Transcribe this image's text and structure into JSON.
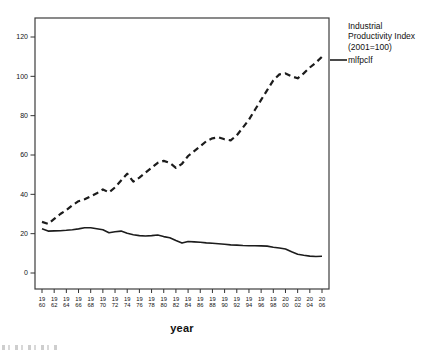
{
  "figure": {
    "background": "#ffffff",
    "line_color": "#1c1c1c",
    "border_color": "#3c3c3c",
    "tick_color": "#333333",
    "text_color": "#111111"
  },
  "legend": {
    "series1_lines": [
      "Industrial",
      "Productivity Index",
      "(2001=100)"
    ],
    "series2_label": "mlfpclf"
  },
  "chart_data": {
    "type": "line",
    "title": "",
    "xlabel": "year",
    "ylabel": "",
    "ylim": [
      0,
      120
    ],
    "yticks": [
      0,
      20,
      40,
      60,
      80,
      100,
      120
    ],
    "xticks": [
      1960,
      1962,
      1964,
      1966,
      1968,
      1970,
      1972,
      1974,
      1976,
      1978,
      1980,
      1982,
      1984,
      1986,
      1988,
      1990,
      1992,
      1994,
      1996,
      1998,
      2000,
      2002,
      2004,
      2006
    ],
    "xtick_label_style": "two-line stacked: century over last two digits",
    "grid": false,
    "legend_position": "outside-right-top",
    "x": [
      1960,
      1961,
      1962,
      1963,
      1964,
      1965,
      1966,
      1967,
      1968,
      1969,
      1970,
      1971,
      1972,
      1973,
      1974,
      1975,
      1976,
      1977,
      1978,
      1979,
      1980,
      1981,
      1982,
      1983,
      1984,
      1985,
      1986,
      1987,
      1988,
      1989,
      1990,
      1991,
      1992,
      1993,
      1994,
      1995,
      1996,
      1997,
      1998,
      1999,
      2000,
      2001,
      2002,
      2003,
      2004,
      2005,
      2006
    ],
    "series": [
      {
        "name": "Industrial Productivity Index (2001=100)",
        "style": "dashed",
        "color": "#1c1c1c",
        "values": [
          26,
          25,
          27.5,
          30,
          32,
          34.5,
          36.5,
          37.5,
          39,
          40.5,
          42.5,
          41,
          43.5,
          47,
          50.5,
          46.5,
          48.5,
          51,
          53.5,
          56,
          57,
          56,
          53.5,
          55.5,
          59.5,
          62,
          64.5,
          67,
          68.5,
          69,
          68,
          67.5,
          70,
          74,
          78,
          83,
          88,
          93,
          98,
          101,
          101.5,
          100,
          99,
          101.5,
          104.5,
          107,
          110
        ]
      },
      {
        "name": "mlfpclf",
        "style": "solid",
        "color": "#1c1c1c",
        "values": [
          22.5,
          21.3,
          21.4,
          21.5,
          21.7,
          22,
          22.4,
          23,
          23,
          22.5,
          22,
          20.5,
          21,
          21.3,
          20.2,
          19.5,
          19,
          18.8,
          19,
          19.3,
          18.5,
          17.9,
          16.5,
          15.2,
          16,
          15.8,
          15.6,
          15.3,
          15.1,
          14.9,
          14.6,
          14.3,
          14.2,
          14,
          13.9,
          13.9,
          13.8,
          13.7,
          13.1,
          12.7,
          12.2,
          10.8,
          9.5,
          9,
          8.6,
          8.4,
          8.5
        ]
      }
    ]
  }
}
